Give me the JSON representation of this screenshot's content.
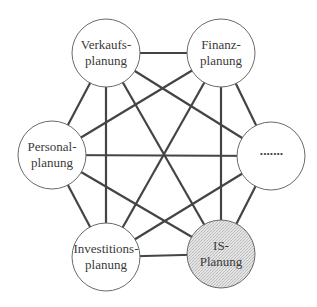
{
  "diagram": {
    "type": "complete-graph",
    "colors": {
      "edge": "#444444",
      "node_fill": "#ffffff",
      "highlight_fill": "#dcdcdc",
      "node_stroke": "#6a6a6a",
      "text": "#3a3a3a"
    },
    "nodes": [
      {
        "id": "verkauf",
        "line1": "Verkaufs-",
        "line2": "planung",
        "cx": 106,
        "cy": 53,
        "r": 34,
        "highlight": false
      },
      {
        "id": "finanz",
        "line1": "Finanz-",
        "line2": "planung",
        "cx": 221,
        "cy": 53,
        "r": 34,
        "highlight": false
      },
      {
        "id": "personal",
        "line1": "Personal-",
        "line2": "planung",
        "cx": 52,
        "cy": 155,
        "r": 34,
        "highlight": false
      },
      {
        "id": "other",
        "line1": "·······",
        "line2": "",
        "cx": 271,
        "cy": 156,
        "r": 34,
        "highlight": false
      },
      {
        "id": "investition",
        "line1": "Investitions-",
        "line2": "planung",
        "cx": 106,
        "cy": 257,
        "r": 34,
        "highlight": false
      },
      {
        "id": "is",
        "line1": "IS-",
        "line2": "Planung",
        "cx": 221,
        "cy": 254,
        "r": 34,
        "highlight": true
      }
    ],
    "edges": [
      [
        "verkauf",
        "finanz"
      ],
      [
        "verkauf",
        "personal"
      ],
      [
        "verkauf",
        "other"
      ],
      [
        "verkauf",
        "investition"
      ],
      [
        "verkauf",
        "is"
      ],
      [
        "finanz",
        "personal"
      ],
      [
        "finanz",
        "other"
      ],
      [
        "finanz",
        "investition"
      ],
      [
        "finanz",
        "is"
      ],
      [
        "personal",
        "other"
      ],
      [
        "personal",
        "investition"
      ],
      [
        "personal",
        "is"
      ],
      [
        "other",
        "investition"
      ],
      [
        "other",
        "is"
      ],
      [
        "investition",
        "is"
      ]
    ]
  }
}
